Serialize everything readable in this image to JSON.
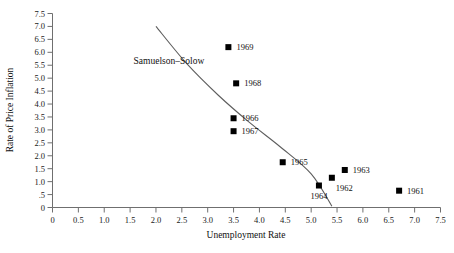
{
  "chart_data": {
    "type": "scatter",
    "title": "",
    "xlabel": "Unemployment Rate",
    "ylabel": "Rate of Price Inflation",
    "xlim": [
      0,
      7.5
    ],
    "ylim": [
      0,
      7.5
    ],
    "grid": false,
    "legend": "none",
    "xticks": [
      {
        "value": 0,
        "label": "0"
      },
      {
        "value": 0.5,
        "label": "0.5"
      },
      {
        "value": 1.0,
        "label": "1.0"
      },
      {
        "value": 1.5,
        "label": "1.5"
      },
      {
        "value": 2.0,
        "label": "2.0"
      },
      {
        "value": 2.5,
        "label": "2.5"
      },
      {
        "value": 3.0,
        "label": "3.0"
      },
      {
        "value": 3.5,
        "label": "3.5"
      },
      {
        "value": 4.0,
        "label": "4.0"
      },
      {
        "value": 4.5,
        "label": "4.5"
      },
      {
        "value": 5.0,
        "label": "5.0"
      },
      {
        "value": 5.5,
        "label": "5.5"
      },
      {
        "value": 6.0,
        "label": "6.0"
      },
      {
        "value": 6.5,
        "label": "6.5"
      },
      {
        "value": 7.0,
        "label": "7.0"
      },
      {
        "value": 7.5,
        "label": "7.5"
      }
    ],
    "yticks": [
      {
        "value": 0,
        "label": "0"
      },
      {
        "value": 0.5,
        "label": ".5"
      },
      {
        "value": 1.0,
        "label": "1.0"
      },
      {
        "value": 1.5,
        "label": "1.5"
      },
      {
        "value": 2.0,
        "label": "2.0"
      },
      {
        "value": 2.5,
        "label": "2.5"
      },
      {
        "value": 3.0,
        "label": "3.0"
      },
      {
        "value": 3.5,
        "label": "3.5"
      },
      {
        "value": 4.0,
        "label": "4.0"
      },
      {
        "value": 4.5,
        "label": "4.5"
      },
      {
        "value": 5.0,
        "label": "5.0"
      },
      {
        "value": 5.5,
        "label": "5.5"
      },
      {
        "value": 6.0,
        "label": "6.0"
      },
      {
        "value": 6.5,
        "label": "6.5"
      },
      {
        "value": 7.0,
        "label": "7.0"
      },
      {
        "value": 7.5,
        "label": "7.5"
      }
    ],
    "points": [
      {
        "label": "1969",
        "x": 3.4,
        "y": 6.2,
        "label_pos": "right"
      },
      {
        "label": "1968",
        "x": 3.55,
        "y": 4.8,
        "label_pos": "right"
      },
      {
        "label": "1966",
        "x": 3.5,
        "y": 3.45,
        "label_pos": "right"
      },
      {
        "label": "1967",
        "x": 3.5,
        "y": 2.95,
        "label_pos": "right"
      },
      {
        "label": "1965",
        "x": 4.45,
        "y": 1.75,
        "label_pos": "right"
      },
      {
        "label": "1963",
        "x": 5.65,
        "y": 1.45,
        "label_pos": "right"
      },
      {
        "label": "1962",
        "x": 5.4,
        "y": 1.15,
        "label_pos": "below-right"
      },
      {
        "label": "1964",
        "x": 5.15,
        "y": 0.85,
        "label_pos": "below"
      },
      {
        "label": "1961",
        "x": 6.7,
        "y": 0.65,
        "label_pos": "right"
      }
    ],
    "annotations": [
      {
        "name": "samuelson-solow-curve",
        "text": "Samuelson–Solow",
        "text_x": 2.25,
        "text_y": 5.55,
        "curve": [
          {
            "x": 2.0,
            "y": 7.0
          },
          {
            "x": 2.6,
            "y": 5.55
          },
          {
            "x": 3.2,
            "y": 4.35
          },
          {
            "x": 3.8,
            "y": 3.3
          },
          {
            "x": 4.4,
            "y": 2.35
          },
          {
            "x": 5.0,
            "y": 1.3
          },
          {
            "x": 5.4,
            "y": 0.05
          }
        ]
      }
    ]
  }
}
